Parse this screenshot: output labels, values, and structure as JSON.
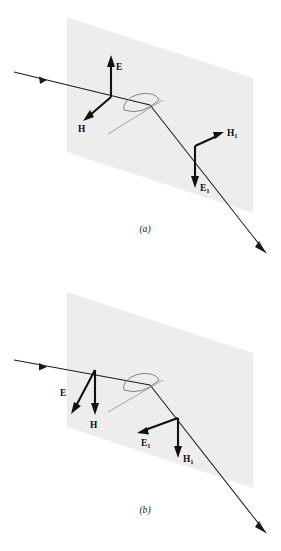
{
  "figure": {
    "type": "optics-ray-diagram",
    "background_color": "#ffffff",
    "plane_fill_color": "#ededed",
    "ray_color": "#1a1a1a",
    "vector_color": "#111111",
    "normal_color": "#9a9a9a",
    "panels": [
      {
        "id": "a",
        "caption": "(a)",
        "caption_x": 145,
        "caption_y": 232,
        "polarization": "perpendicular",
        "plane": {
          "points": "67,17 253,78 253,213 67,152",
          "label": "interface-plane"
        },
        "incident_ray": {
          "from_x": 14,
          "from_y": 72,
          "to_x": 150,
          "to_y": 105,
          "head_x": 47,
          "head_y": 80,
          "head_angle": 13.7
        },
        "refracted_ray": {
          "from_x": 150,
          "from_y": 105,
          "to_x": 266,
          "to_y": 253,
          "head_x": 266,
          "head_y": 253,
          "head_angle": 51.9
        },
        "normal_line": {
          "from_x": 108,
          "from_y": 134,
          "to_x": 163,
          "to_y": 100
        },
        "angle_arc": {
          "cx": 141,
          "cy": 103,
          "rx": 18,
          "ry": 9,
          "rotation": -14
        },
        "vectors": [
          {
            "name": "E",
            "label": "E",
            "subscript": "",
            "origin_x": 111,
            "origin_y": 97,
            "tip_x": 111,
            "tip_y": 58,
            "label_x": 116,
            "label_y": 69
          },
          {
            "name": "H",
            "label": "H",
            "subscript": "",
            "origin_x": 111,
            "origin_y": 97,
            "tip_x": 85,
            "tip_y": 119,
            "label_x": 80,
            "label_y": 131
          },
          {
            "name": "H1",
            "label": "H",
            "subscript": "1",
            "origin_x": 195,
            "origin_y": 146,
            "tip_x": 222,
            "tip_y": 133,
            "label_x": 226,
            "label_y": 135
          },
          {
            "name": "E1",
            "label": "E",
            "subscript": "1",
            "origin_x": 195,
            "origin_y": 146,
            "tip_x": 195,
            "tip_y": 186,
            "label_x": 199,
            "label_y": 191
          }
        ]
      },
      {
        "id": "b",
        "caption": "(b)",
        "caption_x": 145,
        "caption_y": 513,
        "polarization": "parallel",
        "plane": {
          "points": "67,292 253,353 253,488 67,427",
          "label": "interface-plane"
        },
        "incident_ray": {
          "from_x": 14,
          "from_y": 360,
          "to_x": 150,
          "to_y": 385,
          "head_x": 47,
          "head_y": 366,
          "head_angle": 10.4
        },
        "refracted_ray": {
          "from_x": 150,
          "from_y": 385,
          "to_x": 266,
          "to_y": 533,
          "head_x": 266,
          "head_y": 533,
          "head_angle": 51.9
        },
        "normal_line": {
          "from_x": 108,
          "from_y": 412,
          "to_x": 163,
          "to_y": 380
        },
        "angle_arc": {
          "cx": 141,
          "cy": 383,
          "rx": 18,
          "ry": 9,
          "rotation": -12
        },
        "vectors": [
          {
            "name": "E",
            "label": "E",
            "subscript": "",
            "origin_x": 95,
            "origin_y": 370,
            "tip_x": 73,
            "tip_y": 412,
            "label_x": 64,
            "label_y": 395
          },
          {
            "name": "H",
            "label": "H",
            "subscript": "",
            "origin_x": 95,
            "origin_y": 370,
            "tip_x": 95,
            "tip_y": 413,
            "label_x": 92,
            "label_y": 427
          },
          {
            "name": "E1",
            "label": "E",
            "subscript": "1",
            "origin_x": 178,
            "origin_y": 418,
            "tip_x": 139,
            "tip_y": 432,
            "label_x": 143,
            "label_y": 445
          },
          {
            "name": "H1",
            "label": "H",
            "subscript": "1",
            "origin_x": 178,
            "origin_y": 418,
            "tip_x": 178,
            "tip_y": 456,
            "label_x": 182,
            "label_y": 461
          }
        ]
      }
    ]
  }
}
